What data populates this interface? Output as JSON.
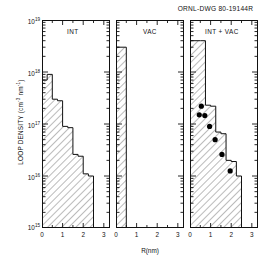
{
  "header": {
    "drawing_id": "ORNL-DWG 80-19144R"
  },
  "axes": {
    "ylabel_text": "LOOP DENSITY",
    "ylabel_units": "(cm",
    "ylabel_units_exp1": "-3",
    "ylabel_units_mid": " nm",
    "ylabel_units_exp2": "-1",
    "ylabel_units_end": ")",
    "ylabel_full": "LOOP DENSITY (cm-3 nm-1)",
    "xlabel": "R(nm)",
    "y_ticks": [
      "10",
      "10",
      "10",
      "10",
      "10"
    ],
    "y_tick_exponents": [
      "19",
      "18",
      "17",
      "16",
      "15"
    ],
    "x_ticks": [
      "0",
      "1",
      "2",
      "3"
    ]
  },
  "chart_data": {
    "type": "bar",
    "title": "ORNL-DWG 80-19144R",
    "xlabel": "R(nm)",
    "ylabel": "LOOP DENSITY (cm-3 nm-1)",
    "yscale": "log",
    "ylim": [
      1000000000000000.0,
      1e+19
    ],
    "xlim": [
      0,
      3.3
    ],
    "grid": false,
    "legend": "none",
    "panels": [
      {
        "label": "INT",
        "bin_edges": [
          0.0,
          0.25,
          0.5,
          0.75,
          1.0,
          1.25,
          1.5,
          1.75,
          2.0,
          2.25,
          2.5
        ],
        "values": [
          7e+17,
          9e+17,
          3e+17,
          2.8e+17,
          9e+16,
          8.5e+16,
          2.6e+16,
          2.4e+16,
          1.1e+16,
          1e+16
        ],
        "points": []
      },
      {
        "label": "VAC",
        "bin_edges": [
          0.0,
          0.5
        ],
        "values": [
          3e+18
        ],
        "points": []
      },
      {
        "label": "INT + VAC",
        "bin_edges": [
          0.0,
          0.5,
          0.75,
          1.0,
          1.25,
          1.5,
          1.75,
          2.0,
          2.25,
          2.5
        ],
        "values": [
          4e+18,
          4e+18,
          2.3e+17,
          2.2e+17,
          7e+16,
          6.5e+16,
          2e+16,
          1.9e+16,
          1e+16
        ],
        "points": [
          {
            "x": 0.55,
            "y": 2.2e+17
          },
          {
            "x": 0.45,
            "y": 1.5e+17
          },
          {
            "x": 0.72,
            "y": 1.45e+17
          },
          {
            "x": 0.95,
            "y": 9e+16
          },
          {
            "x": 1.22,
            "y": 5e+16
          },
          {
            "x": 1.55,
            "y": 2.6e+16
          },
          {
            "x": 1.95,
            "y": 1.25e+16
          }
        ]
      }
    ]
  },
  "colors": {
    "axis": "#111111",
    "hatch": "#555555",
    "marker": "#000000",
    "background": "#ffffff"
  }
}
